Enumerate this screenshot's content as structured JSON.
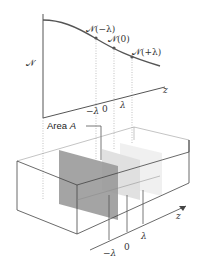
{
  "top_plot": {
    "y_axis_label": "𝒩",
    "x_axis_label": "z",
    "points": [
      {
        "label": "𝒩(−λ)",
        "z": "−λ"
      },
      {
        "label": "𝒩(0)",
        "z": "0"
      },
      {
        "label": "𝒩(+λ)",
        "z": "λ"
      }
    ],
    "x_ticks": [
      "−λ",
      "0",
      "λ"
    ]
  },
  "box": {
    "area_label_prefix": "Area ",
    "area_label_var": "A",
    "z_label": "z",
    "plane_ticks": [
      "−λ",
      "0",
      "λ"
    ],
    "plane_colors": [
      "#9a9a9a",
      "#dcdcdc",
      "#ececec"
    ]
  }
}
